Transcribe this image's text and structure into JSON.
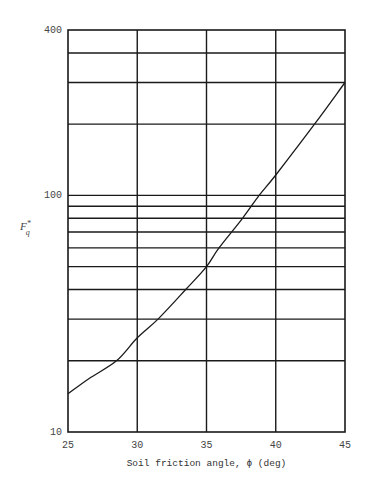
{
  "chart_data": {
    "type": "line",
    "title": "",
    "xlabel": "Soil friction angle, ϕ (deg)",
    "ylabel": {
      "base": "F",
      "sup": "*",
      "sub": "q"
    },
    "xscale": "linear",
    "yscale": "log",
    "xlim": [
      25,
      45
    ],
    "ylim": [
      10,
      500
    ],
    "grid": true,
    "x_ticks": [
      25,
      30,
      35,
      40,
      45
    ],
    "x_tick_labels": [
      "25",
      "30",
      "35",
      "40",
      "45"
    ],
    "y_tick_labels": [
      {
        "label": "400",
        "at": "top"
      },
      {
        "label": "100",
        "value": 100
      },
      {
        "label": "10",
        "value": 10
      }
    ],
    "y_gridlines": [
      20,
      30,
      40,
      50,
      60,
      70,
      80,
      90,
      100,
      200,
      300,
      400
    ],
    "series": [
      {
        "name": "F*q",
        "x": [
          25,
          26.5,
          28.5,
          30,
          31.5,
          33.5,
          35,
          35.9,
          37.6,
          38.8,
          40,
          42.8,
          45
        ],
        "y": [
          14.5,
          16.8,
          20,
          25,
          30,
          40,
          50,
          60,
          80,
          100,
          122,
          200,
          300
        ]
      }
    ]
  }
}
